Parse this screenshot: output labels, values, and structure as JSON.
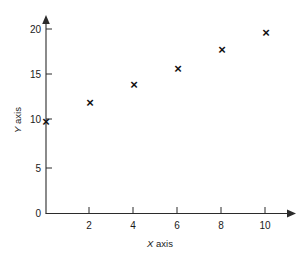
{
  "chart_data": {
    "type": "scatter",
    "title": "",
    "xlabel": "X axis",
    "ylabel": "Y axis",
    "xlabel_var": "X",
    "xlabel_rest": " axis",
    "ylabel_var": "Y",
    "ylabel_rest": " axis",
    "x": [
      0,
      2,
      4,
      6,
      8,
      10
    ],
    "values": [
      10.0,
      12.0,
      14.0,
      15.7,
      17.8,
      19.6
    ],
    "points": [
      {
        "x": 0,
        "y": 10.0
      },
      {
        "x": 2,
        "y": 12.0
      },
      {
        "x": 4,
        "y": 14.0
      },
      {
        "x": 6,
        "y": 15.7
      },
      {
        "x": 8,
        "y": 17.8
      },
      {
        "x": 10,
        "y": 19.6
      }
    ],
    "marker": "x",
    "marker_glyph": "×",
    "marker_color": "#111111",
    "xlim": [
      0,
      11.5
    ],
    "ylim": [
      0,
      22
    ],
    "xticks": [
      2,
      4,
      6,
      8,
      10
    ],
    "xtick_labels": [
      "2",
      "4",
      "6",
      "8",
      "10"
    ],
    "yticks": [
      0,
      5,
      10,
      15,
      20
    ],
    "ytick_labels": [
      "0",
      "5",
      "10",
      "15",
      "20"
    ],
    "grid": false,
    "legend": null,
    "legend_position": "none",
    "axis_color": "#2b2b2b",
    "background_color": "#ffffff",
    "axis_arrows": true,
    "annotations": []
  },
  "figure": {
    "width": 305,
    "height": 257
  }
}
